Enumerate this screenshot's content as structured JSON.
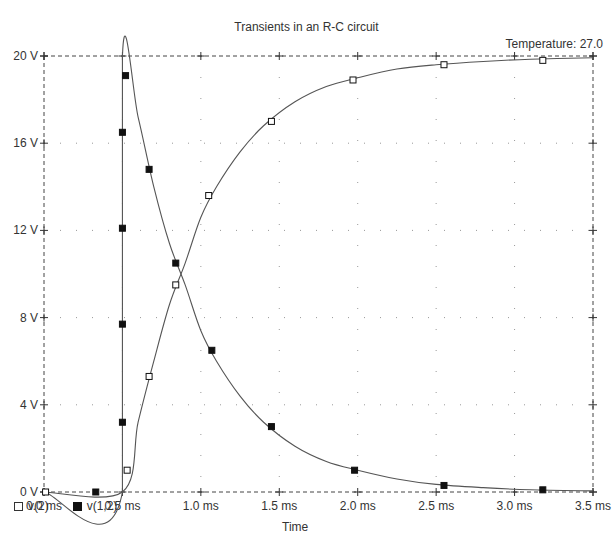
{
  "chart_data": {
    "type": "line",
    "title": "Transients in an R-C circuit",
    "annotation": "Temperature: 27.0",
    "xlabel": "Time",
    "ylabel": "",
    "xlim": [
      0.0,
      3.5
    ],
    "ylim": [
      0,
      20
    ],
    "x_unit": "ms",
    "y_unit": "V",
    "x_ticks": [
      "0.0 ms",
      "0.5 ms",
      "1.0 ms",
      "1.5 ms",
      "2.0 ms",
      "2.5 ms",
      "3.0 ms",
      "3.5 ms"
    ],
    "x_tick_values": [
      0.0,
      0.5,
      1.0,
      1.5,
      2.0,
      2.5,
      3.0,
      3.5
    ],
    "y_ticks": [
      "0 V",
      "4 V",
      "8 V",
      "12 V",
      "16 V",
      "20 V"
    ],
    "y_tick_values": [
      0,
      4,
      8,
      12,
      16,
      20
    ],
    "grid": true,
    "legend_position": "bottom-left",
    "series": [
      {
        "name": "v(2)",
        "marker": "open-square",
        "curve": [
          [
            0,
            0
          ],
          [
            0.5,
            0
          ],
          [
            0.6,
            3.2
          ],
          [
            0.7,
            6.0
          ],
          [
            0.8,
            8.6
          ],
          [
            0.9,
            10.5
          ],
          [
            1.0,
            12.6
          ],
          [
            1.1,
            14.0
          ],
          [
            1.25,
            15.6
          ],
          [
            1.4,
            16.8
          ],
          [
            1.6,
            17.9
          ],
          [
            1.8,
            18.6
          ],
          [
            2.0,
            19.0
          ],
          [
            2.25,
            19.4
          ],
          [
            2.5,
            19.6
          ],
          [
            2.8,
            19.75
          ],
          [
            3.1,
            19.85
          ],
          [
            3.5,
            19.92
          ]
        ],
        "markers": [
          [
            0.01,
            0
          ],
          [
            0.53,
            1.0
          ],
          [
            0.67,
            5.3
          ],
          [
            0.84,
            9.5
          ],
          [
            1.05,
            13.6
          ],
          [
            1.45,
            17.0
          ],
          [
            1.97,
            18.9
          ],
          [
            2.55,
            19.6
          ],
          [
            3.18,
            19.8
          ]
        ]
      },
      {
        "name": "v(1,2)",
        "marker": "filled-square",
        "curve": [
          [
            0,
            0
          ],
          [
            0.5,
            0
          ],
          [
            0.5,
            20
          ],
          [
            0.6,
            17.2
          ],
          [
            0.7,
            14.0
          ],
          [
            0.8,
            11.4
          ],
          [
            0.9,
            9.5
          ],
          [
            1.0,
            7.4
          ],
          [
            1.1,
            6.0
          ],
          [
            1.25,
            4.4
          ],
          [
            1.4,
            3.2
          ],
          [
            1.6,
            2.1
          ],
          [
            1.8,
            1.4
          ],
          [
            2.0,
            1.0
          ],
          [
            2.25,
            0.6
          ],
          [
            2.5,
            0.35
          ],
          [
            2.8,
            0.2
          ],
          [
            3.1,
            0.1
          ],
          [
            3.5,
            0.05
          ]
        ],
        "markers": [
          [
            0.33,
            0
          ],
          [
            0.5,
            3.2
          ],
          [
            0.5,
            7.7
          ],
          [
            0.5,
            12.1
          ],
          [
            0.5,
            16.5
          ],
          [
            0.52,
            19.1
          ],
          [
            0.67,
            14.8
          ],
          [
            0.84,
            10.5
          ],
          [
            1.07,
            6.5
          ],
          [
            1.45,
            3.0
          ],
          [
            1.98,
            1.0
          ],
          [
            2.55,
            0.3
          ],
          [
            3.18,
            0.1
          ]
        ]
      }
    ]
  },
  "legend": {
    "items": [
      {
        "label": "v(2)",
        "swatch": "open-square"
      },
      {
        "label": "v(1,2)",
        "swatch": "filled-square"
      }
    ]
  },
  "colors": {
    "line": "#555555",
    "marker": "#111111",
    "grid": "#999999",
    "text": "#333333"
  }
}
